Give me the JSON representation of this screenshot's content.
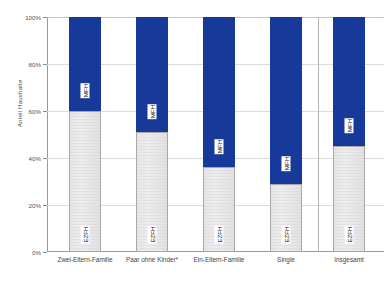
{
  "chart_data": {
    "type": "bar",
    "subtype": "stacked-100-percent",
    "title": "",
    "xlabel": "",
    "ylabel": "Anteil Haushalte",
    "ylim": [
      0,
      100
    ],
    "y_unit": "%",
    "grid": true,
    "legend_position": "inline-labels",
    "categories": [
      "Zwei-Eltern-Familie",
      "Paar ohne Kinder*",
      "Ein-Eltern-Familie",
      "Single",
      "Insgesamt"
    ],
    "series": [
      {
        "name": "EZFH",
        "color": "#e8e8e8",
        "values": [
          60,
          51,
          36,
          29,
          45
        ]
      },
      {
        "name": "MFH",
        "color": "#17399a",
        "values": [
          40,
          49,
          64,
          71,
          55
        ]
      }
    ],
    "tick_labels": [
      "0%",
      "20%",
      "40%",
      "60%",
      "80%",
      "100%"
    ],
    "tick_values": [
      0,
      20,
      40,
      60,
      80,
      100
    ],
    "separator_after_category": "Single",
    "annotations": []
  },
  "colors": {
    "mfh": "#17399a",
    "ezfh": "#e8e8e8",
    "axis": "#9a9a9a",
    "grid": "#dcdcdc",
    "text": "#3f3f3f",
    "background": "#ffffff"
  }
}
